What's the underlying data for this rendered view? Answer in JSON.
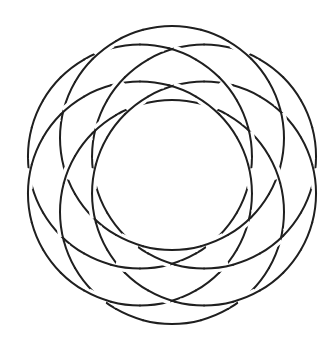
{
  "diagram": {
    "type": "knot-diagram",
    "center": [
      172,
      175
    ],
    "component_count": 6,
    "circle_radius": 112,
    "center_offset": 37,
    "angles_deg": [
      -90,
      -30,
      30,
      90,
      150,
      210
    ],
    "stroke_color": "#1f1f1f",
    "background": "#ffffff",
    "stroke_width": 2
  }
}
